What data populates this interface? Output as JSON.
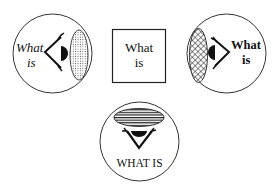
{
  "diagram": {
    "panels": [
      {
        "id": "left",
        "shape": "circle",
        "text_line1": "What",
        "text_line2": "is",
        "text_style": "italic",
        "eye_direction": "right",
        "screen_pattern": "dotted",
        "screen_side": "right"
      },
      {
        "id": "center",
        "shape": "square",
        "text_line1": "What",
        "text_line2": "is",
        "text_style": "regular"
      },
      {
        "id": "right",
        "shape": "circle",
        "text_line1": "What",
        "text_line2": "is",
        "text_style": "bold",
        "eye_direction": "left",
        "screen_pattern": "crosshatch",
        "screen_side": "left"
      },
      {
        "id": "bottom",
        "shape": "circle",
        "text_line1": "WHAT IS",
        "text_style": "uppercase",
        "eye_direction": "up",
        "screen_pattern": "horizontal-stripes",
        "screen_side": "top"
      }
    ],
    "colors": {
      "stroke": "#333333",
      "fill": "#111111",
      "background": "#ffffff"
    }
  }
}
